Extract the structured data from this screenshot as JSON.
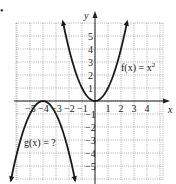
{
  "problem_marker": "•",
  "axes": {
    "x_label": "x",
    "y_label": "y",
    "x_ticks": [
      "−5",
      "−4",
      "−3",
      "−2",
      "−1",
      "1",
      "2",
      "3",
      "4"
    ],
    "y_ticks": [
      "5",
      "4",
      "3",
      "2",
      "1",
      "−1",
      "−2",
      "−3",
      "−4",
      "−5"
    ]
  },
  "functions": {
    "f_label": "f(x) = x",
    "f_exponent": "2",
    "g_label": "g(x) = ?"
  },
  "chart_data": {
    "type": "line",
    "title": "",
    "xlabel": "x",
    "ylabel": "y",
    "xlim": [
      -6,
      5.2
    ],
    "ylim": [
      -6,
      6
    ],
    "grid": true,
    "series": [
      {
        "name": "f(x) = x^2",
        "x": [
          -2.45,
          -2,
          -1.5,
          -1,
          -0.5,
          0,
          0.5,
          1,
          1.5,
          2,
          2.45
        ],
        "y": [
          6,
          4,
          2.25,
          1,
          0.25,
          0,
          0.25,
          1,
          2.25,
          4,
          6
        ]
      },
      {
        "name": "g(x) = ?",
        "x": [
          -6.5,
          -6,
          -5.5,
          -5,
          -4.5,
          -4,
          -3.5,
          -3,
          -2.5,
          -2,
          -1.5
        ],
        "y": [
          -6.25,
          -4,
          -2.25,
          -1,
          -0.25,
          0,
          -0.25,
          -1,
          -2.25,
          -4,
          -6.25
        ]
      }
    ],
    "annotations": [
      "f(x) = x^2",
      "g(x) = ?"
    ]
  }
}
